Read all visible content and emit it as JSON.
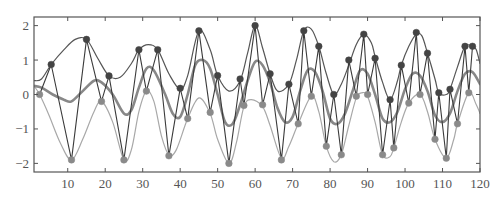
{
  "chart_data": {
    "type": "line",
    "title": "",
    "xlabel": "",
    "ylabel": "",
    "xlim": [
      1,
      120
    ],
    "ylim": [
      -2.25,
      2.25
    ],
    "grid": false,
    "legend": null,
    "x_ticks": [
      10,
      20,
      30,
      40,
      50,
      60,
      70,
      80,
      90,
      100,
      110,
      120
    ],
    "y_ticks": [
      -2,
      -1,
      0,
      1,
      2
    ],
    "x_tick_labels": [
      "10",
      "20",
      "30",
      "40",
      "50",
      "60",
      "70",
      "80",
      "90",
      "100",
      "110",
      "120"
    ],
    "y_tick_labels": [
      "−2",
      "−1",
      "0",
      "1",
      "2"
    ],
    "series": [
      {
        "name": "upper-curve",
        "color": "#555555",
        "width": 1.2,
        "points": [
          [
            1,
            0.4
          ],
          [
            3,
            0.45
          ],
          [
            5.6,
            0.87
          ],
          [
            9,
            1.3
          ],
          [
            12,
            1.6
          ],
          [
            15,
            1.6
          ],
          [
            18,
            1.05
          ],
          [
            21,
            0.54
          ],
          [
            24,
            0.5
          ],
          [
            27,
            0.9
          ],
          [
            29,
            1.3
          ],
          [
            31.5,
            1.45
          ],
          [
            34,
            1.3
          ],
          [
            37,
            0.6
          ],
          [
            40,
            0.15
          ],
          [
            42,
            0.55
          ],
          [
            45,
            1.85
          ],
          [
            48,
            1.3
          ],
          [
            50,
            0.55
          ],
          [
            53,
            0.1
          ],
          [
            56,
            0.4
          ],
          [
            58,
            1.2
          ],
          [
            60,
            2.0
          ],
          [
            62,
            1.35
          ],
          [
            64,
            0.6
          ],
          [
            66,
            0.1
          ],
          [
            69,
            0.3
          ],
          [
            71,
            1.0
          ],
          [
            73,
            1.85
          ],
          [
            75,
            1.9
          ],
          [
            77,
            1.4
          ],
          [
            79,
            0.6
          ],
          [
            81,
            0.0
          ],
          [
            83,
            0.3
          ],
          [
            85,
            0.85
          ],
          [
            87,
            1.45
          ],
          [
            89,
            1.75
          ],
          [
            91,
            1.5
          ],
          [
            92,
            1.1
          ],
          [
            94,
            0.35
          ],
          [
            96,
            -0.15
          ],
          [
            98,
            0.4
          ],
          [
            99,
            0.85
          ],
          [
            101,
            1.4
          ],
          [
            103,
            1.75
          ],
          [
            104.5,
            1.7
          ],
          [
            106,
            1.2
          ],
          [
            108,
            0.45
          ],
          [
            109,
            0.05
          ],
          [
            111,
            0.0
          ],
          [
            112,
            0.15
          ],
          [
            114,
            0.8
          ],
          [
            116,
            1.4
          ],
          [
            118,
            1.4
          ],
          [
            119,
            1.3
          ],
          [
            120,
            0.9
          ]
        ]
      },
      {
        "name": "mean-curve",
        "color": "#888888",
        "width": 2.6,
        "points": [
          [
            1,
            0.25
          ],
          [
            3,
            0.2
          ],
          [
            6,
            0.0
          ],
          [
            9,
            -0.15
          ],
          [
            11,
            -0.2
          ],
          [
            14,
            0.1
          ],
          [
            17,
            0.4
          ],
          [
            19,
            0.35
          ],
          [
            22,
            0.0
          ],
          [
            25,
            -0.55
          ],
          [
            27,
            -0.45
          ],
          [
            29,
            0.2
          ],
          [
            31,
            0.75
          ],
          [
            33,
            0.7
          ],
          [
            36,
            0.0
          ],
          [
            38,
            -0.55
          ],
          [
            40,
            -0.65
          ],
          [
            42,
            0.0
          ],
          [
            44,
            0.85
          ],
          [
            46,
            1.0
          ],
          [
            48,
            0.75
          ],
          [
            50,
            0.0
          ],
          [
            52,
            -0.8
          ],
          [
            54,
            -0.85
          ],
          [
            56,
            -0.3
          ],
          [
            58,
            0.4
          ],
          [
            60,
            0.95
          ],
          [
            62,
            0.85
          ],
          [
            64,
            0.35
          ],
          [
            66,
            -0.4
          ],
          [
            68,
            -0.8
          ],
          [
            70,
            -0.65
          ],
          [
            72,
            0.1
          ],
          [
            74,
            0.7
          ],
          [
            76,
            0.65
          ],
          [
            78,
            0.1
          ],
          [
            80,
            -0.7
          ],
          [
            82,
            -0.85
          ],
          [
            84,
            -0.55
          ],
          [
            86,
            0.1
          ],
          [
            88,
            0.7
          ],
          [
            90,
            0.6
          ],
          [
            92,
            0.0
          ],
          [
            94,
            -0.7
          ],
          [
            96,
            -0.8
          ],
          [
            98,
            -0.5
          ],
          [
            100,
            0.15
          ],
          [
            102,
            0.6
          ],
          [
            104,
            0.55
          ],
          [
            106,
            0.1
          ],
          [
            108,
            -0.6
          ],
          [
            110,
            -0.8
          ],
          [
            112,
            -0.55
          ],
          [
            114,
            0.1
          ],
          [
            116,
            0.6
          ],
          [
            118,
            0.65
          ],
          [
            120,
            0.3
          ]
        ]
      },
      {
        "name": "lower-curve",
        "color": "#a8a8a8",
        "width": 1.2,
        "points": [
          [
            1,
            0.25
          ],
          [
            2.5,
            0.0
          ],
          [
            5,
            -0.6
          ],
          [
            8,
            -1.4
          ],
          [
            11,
            -1.9
          ],
          [
            14,
            -1.3
          ],
          [
            17,
            -0.5
          ],
          [
            19,
            -0.2
          ],
          [
            22,
            -0.8
          ],
          [
            25,
            -1.9
          ],
          [
            27,
            -1.6
          ],
          [
            29,
            -0.5
          ],
          [
            31,
            0.1
          ],
          [
            33,
            -0.2
          ],
          [
            35,
            -1.2
          ],
          [
            37,
            -1.75
          ],
          [
            39,
            -1.6
          ],
          [
            42,
            -0.7
          ],
          [
            45,
            -0.1
          ],
          [
            48,
            -0.55
          ],
          [
            50,
            -1.3
          ],
          [
            53,
            -2.0
          ],
          [
            55,
            -1.4
          ],
          [
            57,
            -0.35
          ],
          [
            59,
            -0.15
          ],
          [
            62,
            -0.35
          ],
          [
            64,
            -0.9
          ],
          [
            67,
            -1.85
          ],
          [
            69,
            -1.5
          ],
          [
            71.5,
            -0.85
          ],
          [
            75,
            -0.05
          ],
          [
            77,
            -0.5
          ],
          [
            79,
            -1.5
          ],
          [
            81,
            -1.95
          ],
          [
            83,
            -1.75
          ],
          [
            85,
            -0.9
          ],
          [
            87,
            -0.1
          ],
          [
            88.5,
            0.05
          ],
          [
            90,
            -0.05
          ],
          [
            92,
            -0.8
          ],
          [
            94,
            -1.75
          ],
          [
            96,
            -1.8
          ],
          [
            97,
            -1.55
          ],
          [
            99,
            -0.8
          ],
          [
            101,
            -0.25
          ],
          [
            104,
            0.0
          ],
          [
            106,
            -0.5
          ],
          [
            108,
            -1.3
          ],
          [
            111,
            -1.85
          ],
          [
            113,
            -1.3
          ],
          [
            114,
            -0.85
          ],
          [
            117,
            0.05
          ],
          [
            119,
            -0.3
          ],
          [
            120,
            -0.55
          ]
        ]
      }
    ],
    "markers_upper": {
      "name": "upper-samples",
      "color": "#444444",
      "points": [
        [
          5.6,
          0.87
        ],
        [
          15,
          1.6
        ],
        [
          21,
          0.54
        ],
        [
          29,
          1.3
        ],
        [
          34,
          1.3
        ],
        [
          40,
          0.18
        ],
        [
          45,
          1.85
        ],
        [
          50,
          0.55
        ],
        [
          56,
          0.45
        ],
        [
          60,
          2.0
        ],
        [
          64,
          0.6
        ],
        [
          69,
          0.3
        ],
        [
          73,
          1.85
        ],
        [
          77,
          1.4
        ],
        [
          81,
          0.0
        ],
        [
          85,
          1.0
        ],
        [
          89,
          1.75
        ],
        [
          92,
          1.05
        ],
        [
          96,
          -0.15
        ],
        [
          99,
          0.85
        ],
        [
          103,
          1.8
        ],
        [
          106,
          1.2
        ],
        [
          109,
          0.05
        ],
        [
          112,
          0.15
        ],
        [
          116,
          1.4
        ],
        [
          118,
          1.4
        ]
      ]
    },
    "markers_lower": {
      "name": "lower-samples",
      "color": "#8a8a8a",
      "points": [
        [
          2.5,
          0.0
        ],
        [
          11,
          -1.9
        ],
        [
          19,
          -0.2
        ],
        [
          25,
          -1.9
        ],
        [
          31,
          0.1
        ],
        [
          37,
          -1.78
        ],
        [
          42,
          -0.7
        ],
        [
          48,
          -0.52
        ],
        [
          53,
          -2.0
        ],
        [
          57,
          -0.32
        ],
        [
          62,
          -0.3
        ],
        [
          67,
          -1.9
        ],
        [
          71.5,
          -0.85
        ],
        [
          75,
          -0.05
        ],
        [
          79,
          -1.5
        ],
        [
          83,
          -1.75
        ],
        [
          87,
          -0.05
        ],
        [
          90,
          0.0
        ],
        [
          94,
          -1.75
        ],
        [
          97,
          -1.55
        ],
        [
          101,
          -0.25
        ],
        [
          104,
          0.0
        ],
        [
          108,
          -1.3
        ],
        [
          111,
          -1.85
        ],
        [
          114,
          -0.85
        ],
        [
          117,
          0.05
        ]
      ]
    },
    "zigzag": {
      "name": "sample-path",
      "color": "#3a3a3a",
      "width": 1.1
    }
  },
  "frame": {
    "left": 34,
    "right": 480,
    "top": 17,
    "bottom": 172
  }
}
